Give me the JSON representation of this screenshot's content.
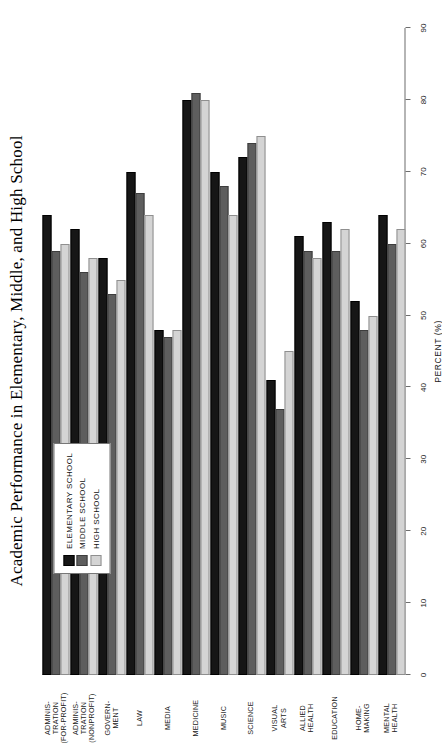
{
  "chart_data": {
    "type": "bar",
    "orientation": "horizontal",
    "title": "Academic Performance in Elementary, Middle, and High School",
    "xlabel": "PERCENT (%)",
    "ylabel": "",
    "xlim": [
      0,
      90
    ],
    "xticks": [
      0,
      10,
      20,
      30,
      40,
      50,
      60,
      70,
      80,
      90
    ],
    "xticklabels": [
      "0",
      "10",
      "20",
      "30",
      "40",
      "50",
      "60",
      "70",
      "80",
      "90"
    ],
    "grid": false,
    "legend_position": "upper-left",
    "categories": [
      "ADMINIS-\nTRATION\n(FOR-PROFIT)",
      "ADMINIS-\nTRATION\n(NONPROFIT)",
      "GOVERN-\nMENT",
      "LAW",
      "MEDIA",
      "MEDICINE",
      "MUSIC",
      "SCIENCE",
      "VISUAL\nARTS",
      "ALLIED\nHEALTH",
      "EDUCATION",
      "HOME-\nMAKING",
      "MENTAL\nHEALTH"
    ],
    "series": [
      {
        "name": "ELEMENTARY SCHOOL",
        "color": "#161616",
        "values": [
          64,
          62,
          58,
          70,
          48,
          80,
          70,
          72,
          41,
          61,
          63,
          52,
          64
        ]
      },
      {
        "name": "MIDDLE SCHOOL",
        "color": "#5e5e5e",
        "values": [
          59,
          56,
          53,
          67,
          47,
          81,
          68,
          74,
          37,
          59,
          59,
          48,
          60
        ]
      },
      {
        "name": "HIGH SCHOOL",
        "color": "#d4d4d4",
        "values": [
          60,
          58,
          55,
          64,
          48,
          80,
          64,
          75,
          45,
          58,
          62,
          50,
          62
        ]
      }
    ]
  },
  "legend": {
    "items": [
      {
        "label": "ELEMENTARY SCHOOL",
        "swatch": "elementary"
      },
      {
        "label": "MIDDLE SCHOOL",
        "swatch": "middle"
      },
      {
        "label": "HIGH SCHOOL",
        "swatch": "high"
      }
    ]
  }
}
